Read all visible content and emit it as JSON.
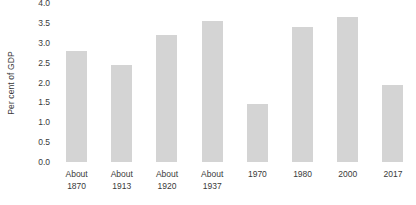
{
  "chart_data": {
    "type": "bar",
    "title": "",
    "xlabel": "",
    "ylabel": "Per cent of GDP",
    "ylim": [
      0.0,
      4.0
    ],
    "ytick_labels": [
      "0.0",
      "0.5",
      "1.0",
      "1.5",
      "2.0",
      "2.5",
      "3.0",
      "3.5",
      "4.0"
    ],
    "ytick_values": [
      0.0,
      0.5,
      1.0,
      1.5,
      2.0,
      2.5,
      3.0,
      3.5,
      4.0
    ],
    "grid": false,
    "legend": null,
    "bar_color": "#d4d4d4",
    "text_color": "#3a3a3a",
    "background_color": "#ffffff",
    "categories": [
      "About 1870",
      "About 1913",
      "About 1920",
      "About 1937",
      "1970",
      "1980",
      "2000",
      "2017"
    ],
    "category_lines": [
      [
        "About",
        "1870"
      ],
      [
        "About",
        "1913"
      ],
      [
        "About",
        "1920"
      ],
      [
        "About",
        "1937"
      ],
      [
        "1970",
        ""
      ],
      [
        "1980",
        ""
      ],
      [
        "2000",
        ""
      ],
      [
        "2017",
        ""
      ]
    ],
    "values": [
      2.8,
      2.45,
      3.2,
      3.55,
      1.45,
      3.4,
      3.65,
      1.95
    ]
  }
}
